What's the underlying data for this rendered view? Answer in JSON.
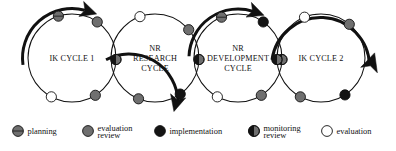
{
  "diagram": {
    "cycles": [
      {
        "id": "ik-cycle-1",
        "label_lines": [
          "IK CYCLE 1"
        ],
        "cx": 72,
        "cy": 58,
        "r": 44,
        "nodes": [
          {
            "type": "planning",
            "angle": -108
          },
          {
            "type": "evaluation-review",
            "angle": -55
          },
          {
            "type": "monitoring-review",
            "angle": 2
          },
          {
            "type": "evaluation-review",
            "angle": 58
          },
          {
            "type": "evaluation",
            "angle": 118
          }
        ]
      },
      {
        "id": "nr-research-cycle",
        "label_lines": [
          "NR",
          "RESEARCH",
          "CYCLE"
        ],
        "cx": 155,
        "cy": 58,
        "r": 44,
        "nodes": [
          {
            "type": "evaluation",
            "angle": -110
          },
          {
            "type": "evaluation-review",
            "angle": -40
          },
          {
            "type": "monitoring-review",
            "angle": 2
          },
          {
            "type": "implementation",
            "angle": 55
          },
          {
            "type": "evaluation-review",
            "angle": 112
          }
        ]
      },
      {
        "id": "nr-development-cycle",
        "label_lines": [
          "NR",
          "DEVELOPMENT",
          "CYCLE"
        ],
        "cx": 238,
        "cy": 58,
        "r": 44,
        "nodes": [
          {
            "type": "planning",
            "angle": -112
          },
          {
            "type": "implementation",
            "angle": -55
          },
          {
            "type": "monitoring-review",
            "angle": 2
          },
          {
            "type": "evaluation-review",
            "angle": 58
          },
          {
            "type": "evaluation",
            "angle": 118
          }
        ]
      },
      {
        "id": "ik-cycle-2",
        "label_lines": [
          "IK CYCLE 2"
        ],
        "cx": 321,
        "cy": 58,
        "r": 44,
        "nodes": [
          {
            "type": "evaluation",
            "angle": -112
          },
          {
            "type": "evaluation-review",
            "angle": -50
          },
          {
            "type": "monitoring-review",
            "angle": 178
          },
          {
            "type": "implementation",
            "angle": 57
          },
          {
            "type": "evaluation-review",
            "angle": 118
          }
        ]
      }
    ]
  },
  "legend": {
    "items": [
      {
        "key": "planning",
        "label": "planning",
        "marker": "circle-gray-hline"
      },
      {
        "key": "evaluation-review",
        "label": "evaluation\nreview",
        "label_line1": "evaluation",
        "label_line2": "review",
        "marker": "circle-gray"
      },
      {
        "key": "implementation",
        "label": "implementation",
        "marker": "circle-black"
      },
      {
        "key": "monitoring-review",
        "label": "monitoring\nreview",
        "label_line1": "monitoring",
        "label_line2": "review",
        "marker": "circle-half"
      },
      {
        "key": "evaluation",
        "label": "evaluation",
        "marker": "circle-white"
      }
    ]
  },
  "colors": {
    "stroke": "#111111",
    "gray_fill": "#6f6f6f",
    "black_fill": "#141414",
    "white_fill": "#ffffff",
    "background": "#ffffff"
  }
}
